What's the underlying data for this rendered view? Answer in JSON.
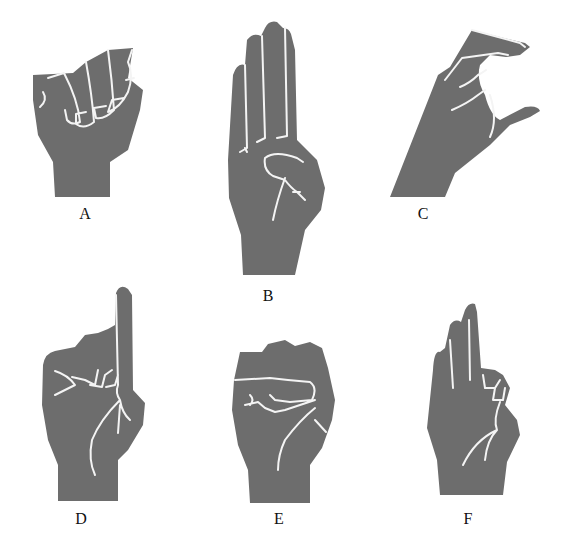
{
  "diagram": {
    "title": "",
    "figures": [
      {
        "id": "A",
        "label": "A",
        "description": "closed fist, thumb alongside"
      },
      {
        "id": "B",
        "label": "B",
        "description": "flat hand, four fingers up, thumb folded across palm"
      },
      {
        "id": "C",
        "label": "C",
        "description": "curved hand forming C shape"
      },
      {
        "id": "D",
        "label": "D",
        "description": "index finger pointing up, others curled touching thumb"
      },
      {
        "id": "E",
        "label": "E",
        "description": "fingers curled down over thumb"
      },
      {
        "id": "F",
        "label": "F",
        "description": "three fingers up, index and thumb touching"
      }
    ],
    "colors": {
      "hand": "#6d6d6d",
      "crease": "#f4f4f4",
      "background": "#ffffff",
      "label": "#111111"
    }
  }
}
